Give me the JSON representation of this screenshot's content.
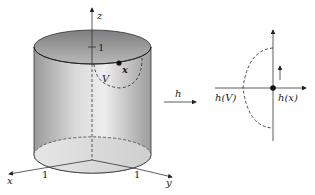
{
  "figure": {
    "left": {
      "title": "cylinder",
      "axis_labels": {
        "z": "z",
        "x": "x",
        "y": "y"
      },
      "ticks": {
        "z": "1",
        "x": "1",
        "y": "1"
      },
      "point_label": "x",
      "neighborhood_label": "V"
    },
    "map": {
      "label": "h"
    },
    "right": {
      "point_label": "h(x)",
      "neighborhood_label": "h(V)"
    },
    "colors": {
      "stroke": "#222222",
      "cylinder_light": "#e8e8e8",
      "cylinder_mid": "#bdbdbd",
      "cylinder_dark": "#8a8a8a"
    }
  }
}
